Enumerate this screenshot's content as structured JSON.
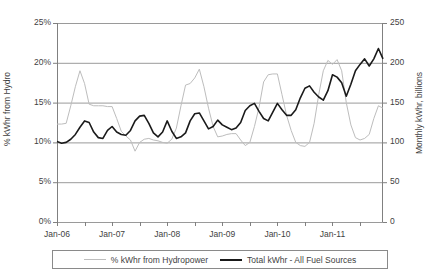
{
  "chart_data": {
    "type": "line",
    "title": "",
    "xlabel": "",
    "ylabel": "% kWhr from Hydro",
    "ylabel_secondary": "Monthly kWhr, billions",
    "grid": true,
    "legend_position": "bottom",
    "ylim": [
      0,
      25
    ],
    "ylim_secondary": [
      0,
      250
    ],
    "ytick_labels": [
      "0%",
      "5%",
      "10%",
      "15%",
      "20%",
      "25%"
    ],
    "ytick_values": [
      0,
      5,
      10,
      15,
      20,
      25
    ],
    "ytick_labels_secondary": [
      "0",
      "50",
      "100",
      "150",
      "200",
      "250"
    ],
    "ytick_values_secondary": [
      0,
      50,
      100,
      150,
      200,
      250
    ],
    "xtick_labels": [
      "Jan-06",
      "Jan-07",
      "Jan-08",
      "Jan-09",
      "Jan-10",
      "Jan-11"
    ],
    "x_minor_tick_interval_months": 6,
    "x_label_interval_months": 12,
    "x_start": "Jan-06",
    "x_end": "Dec-11",
    "n_points": 72,
    "colors": {
      "hydro_line": "#bdbdbd",
      "total_line": "#1a1a1a",
      "gridline": "#9a9a9a",
      "axis": "#808080",
      "text": "#3f3f3f"
    },
    "series": [
      {
        "name": "% kWhr from Hydropower",
        "axis": "left",
        "unit": "%",
        "color": "#bdbdbd",
        "values": [
          12.3,
          12.3,
          12.4,
          14.6,
          17.0,
          19.0,
          17.4,
          14.8,
          14.6,
          14.6,
          14.6,
          14.5,
          14.5,
          13.0,
          11.4,
          10.8,
          10.3,
          8.9,
          10.0,
          10.4,
          10.5,
          10.3,
          10.2,
          10.0,
          9.9,
          10.4,
          11.8,
          14.6,
          17.2,
          17.4,
          18.1,
          19.2,
          17.0,
          14.3,
          12.0,
          10.7,
          10.8,
          11.0,
          11.1,
          11.1,
          10.3,
          9.6,
          10.0,
          12.0,
          14.4,
          17.6,
          18.5,
          18.6,
          18.6,
          16.0,
          13.4,
          11.5,
          10.0,
          9.6,
          9.5,
          10.0,
          12.4,
          16.0,
          19.0,
          20.3,
          19.8,
          20.4,
          19.0,
          15.0,
          12.2,
          10.6,
          10.3,
          10.5,
          11.0,
          13.0,
          14.6,
          14.3
        ]
      },
      {
        "name": "Total kWhr - All Fuel Sources",
        "axis": "right",
        "unit": "billions kWhr",
        "color": "#1a1a1a",
        "values": [
          101,
          99,
          100,
          104,
          110,
          119,
          127,
          125,
          113,
          106,
          105,
          115,
          120,
          113,
          110,
          109,
          115,
          127,
          133,
          134,
          124,
          112,
          107,
          113,
          127,
          114,
          105,
          107,
          112,
          127,
          136,
          137,
          127,
          117,
          120,
          128,
          122,
          119,
          116,
          118,
          125,
          140,
          146,
          149,
          139,
          130,
          127,
          138,
          149,
          141,
          134,
          134,
          141,
          156,
          168,
          171,
          163,
          157,
          153,
          165,
          185,
          182,
          175,
          158,
          173,
          190,
          198,
          205,
          196,
          205,
          218,
          205
        ]
      }
    ]
  },
  "legend": {
    "entries": [
      {
        "label": "% kWhr from Hydropower",
        "style": "thin-gray"
      },
      {
        "label": "Total kWhr - All Fuel Sources",
        "style": "thick-black"
      }
    ]
  }
}
